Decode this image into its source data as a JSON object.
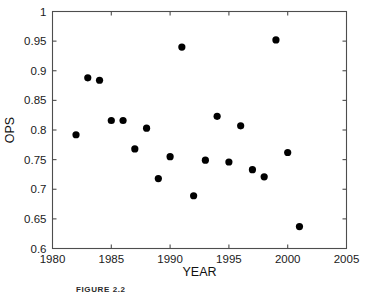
{
  "figure": {
    "caption": "FIGURE 2.2"
  },
  "chart_data": {
    "type": "scatter",
    "title": "",
    "xlabel": "YEAR",
    "ylabel": "OPS",
    "xlim": [
      1980,
      2005
    ],
    "ylim": [
      0.6,
      1
    ],
    "xticks": [
      1980,
      1985,
      1990,
      1995,
      2000,
      2005
    ],
    "xtick_labels": [
      "1980",
      "1985",
      "1990",
      "1995",
      "2000",
      "2005"
    ],
    "yticks": [
      0.6,
      0.65,
      0.7,
      0.75,
      0.8,
      0.85,
      0.9,
      0.95,
      1
    ],
    "ytick_labels": [
      "0.6",
      "0.65",
      "0.7",
      "0.75",
      "0.8",
      "0.85",
      "0.9",
      "0.95",
      "1"
    ],
    "grid": false,
    "legend": null,
    "marker": "filled-circle",
    "marker_color": "#000000",
    "x": [
      1982,
      1983,
      1984,
      1985,
      1986,
      1987,
      1988,
      1989,
      1990,
      1991,
      1992,
      1993,
      1994,
      1995,
      1996,
      1997,
      1998,
      1999,
      2000,
      2001
    ],
    "y": [
      0.792,
      0.888,
      0.884,
      0.816,
      0.816,
      0.768,
      0.803,
      0.718,
      0.755,
      0.94,
      0.689,
      0.749,
      0.823,
      0.746,
      0.807,
      0.733,
      0.721,
      0.952,
      0.762,
      0.637
    ],
    "points": [
      {
        "year": 1982,
        "ops": 0.792
      },
      {
        "year": 1983,
        "ops": 0.888
      },
      {
        "year": 1984,
        "ops": 0.884
      },
      {
        "year": 1985,
        "ops": 0.816
      },
      {
        "year": 1986,
        "ops": 0.816
      },
      {
        "year": 1987,
        "ops": 0.768
      },
      {
        "year": 1988,
        "ops": 0.803
      },
      {
        "year": 1989,
        "ops": 0.718
      },
      {
        "year": 1990,
        "ops": 0.755
      },
      {
        "year": 1991,
        "ops": 0.94
      },
      {
        "year": 1992,
        "ops": 0.689
      },
      {
        "year": 1993,
        "ops": 0.749
      },
      {
        "year": 1994,
        "ops": 0.823
      },
      {
        "year": 1995,
        "ops": 0.746
      },
      {
        "year": 1996,
        "ops": 0.807
      },
      {
        "year": 1997,
        "ops": 0.733
      },
      {
        "year": 1998,
        "ops": 0.721
      },
      {
        "year": 1999,
        "ops": 0.952
      },
      {
        "year": 2000,
        "ops": 0.762
      },
      {
        "year": 2001,
        "ops": 0.637
      }
    ]
  }
}
